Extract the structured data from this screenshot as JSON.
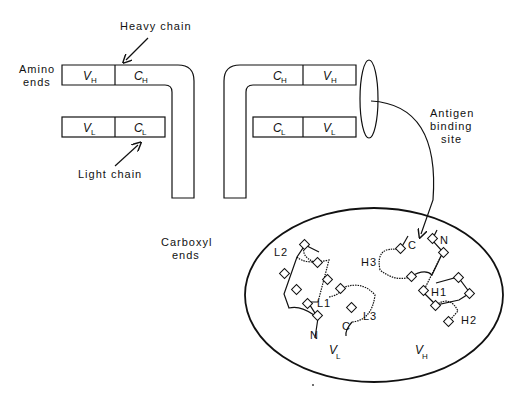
{
  "labels": {
    "heavy_chain": "Heavy chain",
    "light_chain": "Light chain",
    "amino_ends_1": "Amino",
    "amino_ends_2": "ends",
    "carboxyl_ends_1": "Carboxyl",
    "carboxyl_ends_2": "ends",
    "antigen_1": "Antigen",
    "antigen_2": "binding",
    "antigen_3": "site"
  },
  "domains": {
    "v": "V",
    "c": "C",
    "h": "H",
    "l": "L"
  },
  "loops": {
    "l1": "L1",
    "l2": "L2",
    "l3": "L3",
    "h1": "H1",
    "h2": "H2",
    "h3": "H3",
    "n": "N",
    "c": "C"
  },
  "inset": {
    "vl_main": "V",
    "vl_sub": "L",
    "vh_main": "V",
    "vh_sub": "H"
  }
}
